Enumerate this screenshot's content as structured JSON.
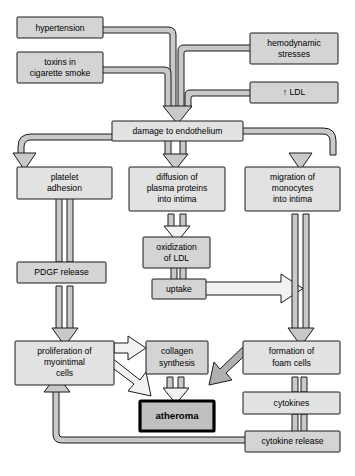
{
  "diagram": {
    "type": "flowchart",
    "colors": {
      "node_fill": "#d4d4d4",
      "node_fill_light": "#e2e2e2",
      "node_stroke": "#1a1a1a",
      "connector_fill": "#c9c9c9",
      "connector_hollow": "#f2f2f2",
      "emphasis_fill": "#c0c0c0",
      "emphasis_stroke": "#000000",
      "background": "#ffffff"
    },
    "nodes": [
      {
        "id": "hypertension",
        "label": "hypertension",
        "lines": [
          "hypertension"
        ]
      },
      {
        "id": "toxins",
        "label": "toxins in cigarette smoke",
        "lines": [
          "toxins in",
          "cigarette smoke"
        ]
      },
      {
        "id": "hemodynamic",
        "label": "hemodynamic stresses",
        "lines": [
          "hemodynamic",
          "stresses"
        ]
      },
      {
        "id": "ldl",
        "label": "↑ LDL",
        "lines": [
          "↑ LDL"
        ]
      },
      {
        "id": "damage",
        "label": "damage to endothelium",
        "lines": [
          "damage to endothelium"
        ]
      },
      {
        "id": "platelet",
        "label": "platelet adhesion",
        "lines": [
          "platelet",
          "adhesion"
        ]
      },
      {
        "id": "diffusion",
        "label": "diffusion of plasma proteins into intima",
        "lines": [
          "diffusion of",
          "plasma proteins",
          "into intima"
        ]
      },
      {
        "id": "migration",
        "label": "migration of monocytes into intima",
        "lines": [
          "migration of",
          "monocytes",
          "into intima"
        ]
      },
      {
        "id": "oxidization",
        "label": "oxidization of LDL",
        "lines": [
          "oxidization",
          "of LDL"
        ]
      },
      {
        "id": "uptake",
        "label": "uptake",
        "lines": [
          "uptake"
        ]
      },
      {
        "id": "pdgf",
        "label": "PDGF release",
        "lines": [
          "PDGF release"
        ]
      },
      {
        "id": "proliferation",
        "label": "proliferation of myointimal cells",
        "lines": [
          "proliferation of",
          "myointimal",
          "cells"
        ]
      },
      {
        "id": "collagen",
        "label": "collagen synthesis",
        "lines": [
          "collagen",
          "synthesis"
        ]
      },
      {
        "id": "foamcells",
        "label": "formation of foam cells",
        "lines": [
          "formation of",
          "foam cells"
        ]
      },
      {
        "id": "atheroma",
        "label": "atheroma",
        "lines": [
          "atheroma"
        ]
      },
      {
        "id": "cytokines",
        "label": "cytokines",
        "lines": [
          "cytokines"
        ]
      },
      {
        "id": "cytokine_release",
        "label": "cytokine release",
        "lines": [
          "cytokine release"
        ]
      }
    ],
    "edges": [
      {
        "from": "hypertension",
        "to": "damage"
      },
      {
        "from": "toxins",
        "to": "damage"
      },
      {
        "from": "hemodynamic",
        "to": "damage"
      },
      {
        "from": "ldl",
        "to": "damage"
      },
      {
        "from": "damage",
        "to": "platelet"
      },
      {
        "from": "damage",
        "to": "diffusion"
      },
      {
        "from": "damage",
        "to": "migration"
      },
      {
        "from": "platelet",
        "to": "pdgf"
      },
      {
        "from": "pdgf",
        "to": "proliferation"
      },
      {
        "from": "diffusion",
        "to": "oxidization"
      },
      {
        "from": "oxidization",
        "to": "uptake"
      },
      {
        "from": "uptake",
        "to": "migration"
      },
      {
        "from": "migration",
        "to": "foamcells"
      },
      {
        "from": "proliferation",
        "to": "collagen"
      },
      {
        "from": "proliferation",
        "to": "atheroma"
      },
      {
        "from": "collagen",
        "to": "atheroma"
      },
      {
        "from": "foamcells",
        "to": "atheroma"
      },
      {
        "from": "foamcells",
        "to": "cytokines"
      },
      {
        "from": "cytokines",
        "to": "cytokine_release"
      },
      {
        "from": "cytokine_release",
        "to": "proliferation"
      }
    ]
  }
}
